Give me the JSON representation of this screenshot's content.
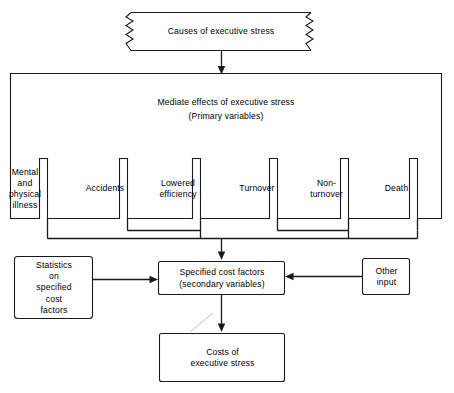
{
  "diagram": {
    "line_color": "#1a1a1a",
    "background_color": "#ffffff",
    "text_color": "#000000"
  },
  "causes_box": {
    "label": "Causes of executive stress",
    "shape": "torn-edge-rectangle"
  },
  "mediate_box": {
    "heading": "Mediate effects of executive stress",
    "subheading": "(Primary variables)"
  },
  "primary_variables": [
    {
      "label": "Mental\nand\nphysical\nillness"
    },
    {
      "label": "Accidents"
    },
    {
      "label": "Lowered\nefficiency"
    },
    {
      "label": "Turnover"
    },
    {
      "label": "Non-turnover"
    },
    {
      "label": "Death"
    }
  ],
  "statistics_box": {
    "label": "Statistics\non\nspecified\ncost\nfactors"
  },
  "specified_cost_box": {
    "line1": "Specified cost factors",
    "line2": "(secondary variables)"
  },
  "other_input_box": {
    "label": "Other\ninput"
  },
  "costs_box": {
    "label": "Costs of\nexecutive stress"
  }
}
